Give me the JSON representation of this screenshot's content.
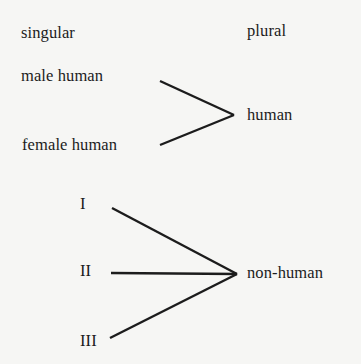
{
  "diagram": {
    "headers": {
      "left": "singular",
      "right": "plural"
    },
    "groups": [
      {
        "target": "human",
        "sources": [
          "male human",
          "female human"
        ]
      },
      {
        "target": "non-human",
        "sources": [
          "I",
          "II",
          "III"
        ]
      }
    ],
    "colors": {
      "background": "#f6f6f4",
      "ink": "#1c1c1c"
    }
  }
}
